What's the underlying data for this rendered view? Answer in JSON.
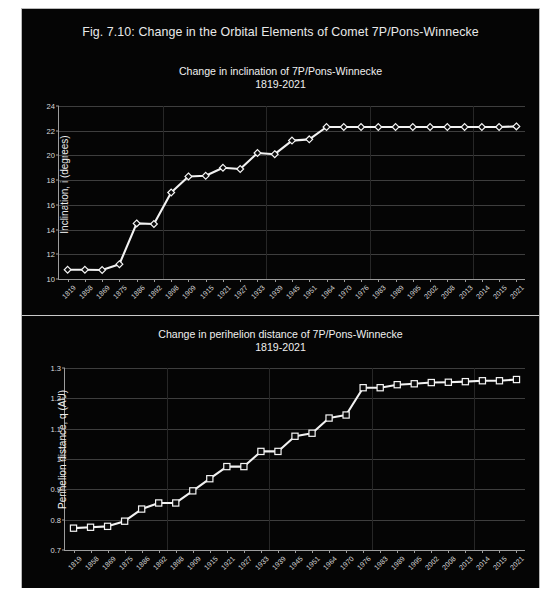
{
  "figure": {
    "caption": "Fig. 7.10: Change in the Orbital Elements of Comet 7P/Pons-Winnecke",
    "background_color": "#050505",
    "series_color": "#f2f2f2"
  },
  "charts": [
    {
      "id": "inclination",
      "title_line1": "Change in inclination of 7P/Pons-Winnecke",
      "title_line2": "1819-2021",
      "ylabel": "Inclination, i (degrees)"
    },
    {
      "id": "perihelion",
      "title_line1": "Change in perihelion distance of 7P/Pons-Winnecke",
      "title_line2": "1819-2021",
      "ylabel": "Perihelion distance, q (AU)"
    }
  ],
  "chart_data": [
    {
      "type": "line",
      "title": "Change in inclination of 7P/Pons-Winnecke 1819-2021",
      "xlabel": "",
      "ylabel": "Inclination, i (degrees)",
      "categories": [
        "1819",
        "1858",
        "1869",
        "1875",
        "1886",
        "1892",
        "1898",
        "1909",
        "1915",
        "1921",
        "1927",
        "1933",
        "1939",
        "1945",
        "1951",
        "1964",
        "1970",
        "1976",
        "1983",
        "1989",
        "1995",
        "2002",
        "2008",
        "2013",
        "2014",
        "2015",
        "2021"
      ],
      "values": [
        10.75,
        10.75,
        10.73,
        11.2,
        14.5,
        14.45,
        17.0,
        18.3,
        18.35,
        19.0,
        18.9,
        20.2,
        20.1,
        21.2,
        21.3,
        22.3,
        22.3,
        22.3,
        22.3,
        22.3,
        22.3,
        22.3,
        22.3,
        22.3,
        22.3,
        22.3,
        22.35
      ],
      "ylim": [
        10,
        24
      ],
      "yticks": [
        10,
        12,
        14,
        16,
        18,
        20,
        22,
        24
      ],
      "marker": "diamond",
      "grid": true,
      "legend": "none"
    },
    {
      "type": "line",
      "title": "Change in perihelion distance of 7P/Pons-Winnecke 1819-2021",
      "xlabel": "",
      "ylabel": "Perihelion distance, q (AU)",
      "categories": [
        "1819",
        "1858",
        "1869",
        "1875",
        "1886",
        "1892",
        "1898",
        "1909",
        "1915",
        "1921",
        "1927",
        "1933",
        "1939",
        "1945",
        "1951",
        "1964",
        "1970",
        "1976",
        "1983",
        "1989",
        "1995",
        "2002",
        "2008",
        "2013",
        "2014",
        "2015",
        "2021"
      ],
      "values": [
        0.772,
        0.775,
        0.778,
        0.795,
        0.835,
        0.855,
        0.855,
        0.895,
        0.935,
        0.975,
        0.975,
        1.025,
        1.025,
        1.075,
        1.085,
        1.135,
        1.145,
        1.235,
        1.235,
        1.245,
        1.248,
        1.252,
        1.253,
        1.255,
        1.258,
        1.258,
        1.262
      ],
      "ylim": [
        0.7,
        1.3
      ],
      "yticks": [
        0.7,
        0.8,
        0.9,
        1,
        1.1,
        1.2,
        1.3
      ],
      "marker": "square",
      "grid": true,
      "legend": "none"
    }
  ]
}
